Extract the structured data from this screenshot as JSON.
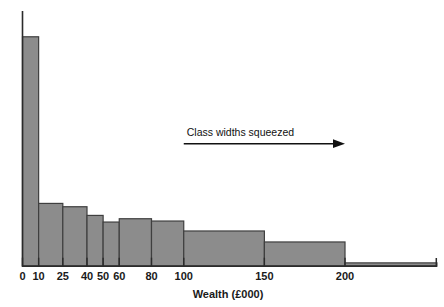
{
  "chart_data": {
    "type": "bar",
    "title": "",
    "subtitle": "",
    "xlabel": "Wealth (£000)",
    "ylabel": "",
    "xlim": [
      0,
      257
    ],
    "ylim": [
      0,
      1
    ],
    "grid": false,
    "legend": null,
    "orientation": "vertical",
    "bar_style": "histogram-unequal-class-widths",
    "x_ticks": [
      0,
      10,
      25,
      40,
      50,
      60,
      80,
      100,
      150,
      200
    ],
    "x_tick_labels": [
      "0",
      "10",
      "25",
      "40",
      "50",
      "60",
      "80",
      "100",
      "150",
      "200"
    ],
    "bins": [
      {
        "label": "0-10",
        "x_start": 0,
        "x_end": 10,
        "height": 0.899
      },
      {
        "label": "10-25",
        "x_start": 10,
        "x_end": 25,
        "height": 0.246
      },
      {
        "label": "25-40",
        "x_start": 25,
        "x_end": 40,
        "height": 0.233
      },
      {
        "label": "40-50",
        "x_start": 40,
        "x_end": 50,
        "height": 0.199
      },
      {
        "label": "50-60",
        "x_start": 50,
        "x_end": 60,
        "height": 0.173
      },
      {
        "label": "60-80",
        "x_start": 60,
        "x_end": 80,
        "height": 0.186
      },
      {
        "label": "80-100",
        "x_start": 80,
        "x_end": 100,
        "height": 0.177
      },
      {
        "label": "100-150",
        "x_start": 100,
        "x_end": 150,
        "height": 0.138
      },
      {
        "label": "150-200",
        "x_start": 150,
        "x_end": 200,
        "height": 0.095
      },
      {
        "label": "200+",
        "x_start": 200,
        "x_end": 257,
        "height": 0.013
      }
    ],
    "categories": [
      "0-10",
      "10-25",
      "25-40",
      "40-50",
      "50-60",
      "60-80",
      "80-100",
      "100-150",
      "150-200",
      "200+"
    ],
    "values": [
      0.899,
      0.246,
      0.233,
      0.199,
      0.173,
      0.186,
      0.177,
      0.138,
      0.095,
      0.013
    ],
    "annotations": [
      {
        "name": "class-widths-squeezed",
        "text": "Class widths squeezed",
        "arrow": {
          "direction": "right",
          "x_start": 100,
          "x_end": 200,
          "y": 0.48
        }
      }
    ],
    "colors": {
      "bar_fill": "#8c8c8c",
      "bar_stroke": "#3f3f3f",
      "axis": "#2b2b2b",
      "text": "#1a1a1a",
      "background": "#ffffff"
    }
  },
  "axis": {
    "x_title": "Wealth (£000)",
    "ticks": [
      "0",
      "10",
      "25",
      "40",
      "50",
      "60",
      "80",
      "100",
      "150",
      "200"
    ]
  },
  "annotation": {
    "text": "Class widths squeezed"
  }
}
